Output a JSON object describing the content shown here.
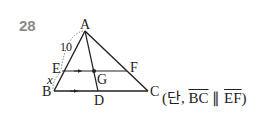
{
  "problem": {
    "number": "28"
  },
  "figure": {
    "points": {
      "A": "A",
      "B": "B",
      "C": "C",
      "D": "D",
      "E": "E",
      "F": "F",
      "G": "G"
    },
    "segment_labels": {
      "AE": "10",
      "EB": "x"
    }
  },
  "condition": {
    "open": "(단, ",
    "seg1": "BC",
    "parallel": " ∥ ",
    "seg2": "EF",
    "close": ")"
  }
}
